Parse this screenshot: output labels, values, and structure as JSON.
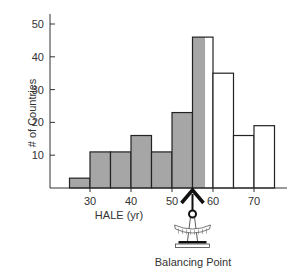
{
  "chart_data": {
    "type": "bar",
    "title": "",
    "xlabel": "HALE (yr)",
    "ylabel": "# of Countries",
    "ylim": [
      0,
      52
    ],
    "yticks": [
      10,
      20,
      30,
      40,
      50
    ],
    "xticks": [
      30,
      40,
      50,
      60,
      70
    ],
    "bin_width": 5,
    "bins": [
      {
        "start": 25,
        "end": 30,
        "count": 3,
        "fill": "gray"
      },
      {
        "start": 30,
        "end": 35,
        "count": 11,
        "fill": "gray"
      },
      {
        "start": 35,
        "end": 40,
        "count": 11,
        "fill": "gray"
      },
      {
        "start": 40,
        "end": 45,
        "count": 16,
        "fill": "gray"
      },
      {
        "start": 45,
        "end": 50,
        "count": 11,
        "fill": "gray"
      },
      {
        "start": 50,
        "end": 55,
        "count": 23,
        "fill": "gray"
      },
      {
        "start": 55,
        "end": 60,
        "count": 46,
        "fill": "split"
      },
      {
        "start": 60,
        "end": 65,
        "count": 35,
        "fill": "white"
      },
      {
        "start": 65,
        "end": 70,
        "count": 16,
        "fill": "white"
      },
      {
        "start": 70,
        "end": 75,
        "count": 19,
        "fill": "white"
      }
    ],
    "balance_point": 55,
    "annotation": "Balancing Point",
    "grid": false,
    "colors": {
      "gray": "#a6a6a6",
      "white": "#ffffff",
      "edge": "#222222"
    }
  },
  "labels": {
    "xlabel": "HALE (yr)",
    "ylabel": "# of Countries",
    "annotation": "Balancing Point"
  }
}
